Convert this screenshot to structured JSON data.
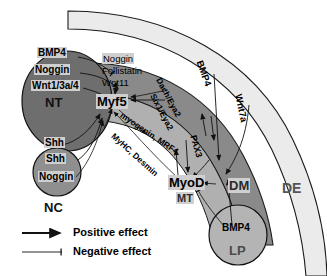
{
  "figure": {
    "type": "biological-signaling-diagram"
  },
  "tissues": [
    {
      "id": "NT",
      "label": "NT",
      "name": "neural-tube",
      "color": "#6e6e6e",
      "shape": "ellipse"
    },
    {
      "id": "NC",
      "label": "NC",
      "name": "notochord",
      "color": "#8f8f8f",
      "shape": "circle"
    },
    {
      "id": "MT",
      "label": "MT",
      "name": "myotome",
      "color": "#b0b0b0",
      "shape": "arc-band"
    },
    {
      "id": "DM",
      "label": "DM",
      "name": "dermomyotome",
      "color": "#8a8a8a",
      "shape": "arc-band"
    },
    {
      "id": "DE",
      "label": "DE",
      "name": "dorsal-ectoderm",
      "color": "#ebebeb",
      "shape": "arc-band"
    },
    {
      "id": "LP",
      "label": "LP",
      "name": "lateral-plate",
      "color": "#b4b4b4",
      "shape": "circle"
    }
  ],
  "nt_signals": {
    "bmp4": "BMP4",
    "noggin": "Noggin",
    "wnt": "Wnt1/3a/4",
    "shh": "Shh"
  },
  "nc_signals": {
    "shh": "Shh",
    "noggin": "Noggin"
  },
  "myotome_box": {
    "noggin": "Noggin",
    "follistatin": "Follistatin",
    "wnt11": "Wnt11"
  },
  "genes": {
    "myf5": "Myf5",
    "myod": "MyoD",
    "pax3": "PAX3",
    "dach_eya2": "Dach/Eya2",
    "six1_eya2": "Six1/Eya2",
    "myogenin_mrf4": "myogenin, MRF4",
    "myhc_desmin": "MyHC, Desmin"
  },
  "ectoderm_signals": {
    "bmp4": "BMP4",
    "wnt7a": "Wnt7a"
  },
  "lp_signals": {
    "bmp4": "BMP4"
  },
  "legend": {
    "positive": "Positive effect",
    "negative": "Negative effect"
  },
  "colors": {
    "nt": "#6e6e6e",
    "nc": "#8f8f8f",
    "mt": "#b0b0b0",
    "dm": "#8a8a8a",
    "de": "#ebebeb",
    "lp": "#b4b4b4",
    "outline": "#1a1a1a",
    "label_box": "#cfcfcf",
    "text": "#000000",
    "tissue_label": "#111111"
  }
}
